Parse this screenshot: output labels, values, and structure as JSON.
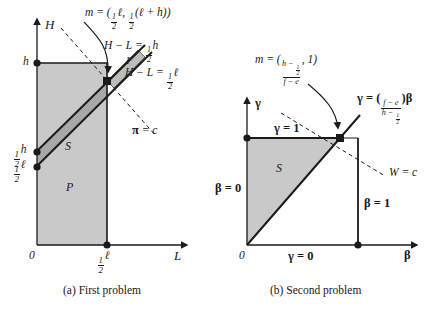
{
  "figure": {
    "kind": "two-panel-geometry-diagram",
    "width": 438,
    "height": 313,
    "background": "#ffffff",
    "ink": "#1a1a1a",
    "fill_light": "#c9c9c9",
    "fill_dark": "#a8a8a8"
  },
  "captions": {
    "a": "(a) First problem",
    "b": "(b) Second problem"
  },
  "panel_a": {
    "axis_y_label": "H",
    "axis_x_label": "L",
    "origin_label": "0",
    "y_tick_h": "h",
    "y_tick_half_h_num": "1",
    "y_tick_half_h_den": "2",
    "y_tick_half_h_sym": "h",
    "y_tick_half_l_num": "1",
    "y_tick_half_l_den": "2",
    "y_tick_half_l_sym": "ℓ",
    "x_tick_half_l_num": "1",
    "x_tick_half_l_den": "2",
    "x_tick_half_l_sym": "ℓ",
    "region_P": "P",
    "region_S": "S",
    "region_I": "I",
    "vertex_label_lhs": "m = (",
    "vertex_label_x_num": "1",
    "vertex_label_x_den": "2",
    "vertex_label_x_sym": "ℓ",
    "vertex_label_comma": ", ",
    "vertex_label_y_num": "1",
    "vertex_label_y_den": "2",
    "vertex_label_y_expr": "(ℓ + h)",
    "vertex_label_rhs": ")",
    "line_upper_lhs": "H − L = ",
    "line_upper_num": "1",
    "line_upper_den": "2",
    "line_upper_sym": "h",
    "line_lower_lhs": "H − L = ",
    "line_lower_num": "1",
    "line_lower_den": "2",
    "line_lower_sym": "ℓ",
    "isoprofit_label_greek": "π",
    "isoprofit_label_rest": " = c"
  },
  "panel_b": {
    "axis_y_label": "γ",
    "axis_x_label": "β",
    "origin_label": "0",
    "region_S": "S",
    "gamma_eq_one": "γ = 1",
    "gamma_eq_zero": "γ = 0",
    "beta_eq_zero": "β = 0",
    "beta_eq_one": "β = 1",
    "vertex_label_lhs": "m = (",
    "vertex_num_lhs": "h − ",
    "vertex_num_frac_num": "1",
    "vertex_num_frac_den": "2",
    "vertex_den": "f − e",
    "vertex_label_rhs": ", 1)",
    "ray_lhs": "γ = (",
    "ray_num": "f − e",
    "ray_den_lhs": "h − ",
    "ray_den_frac_num": "1",
    "ray_den_frac_den": "2",
    "ray_rhs": ")β",
    "isowelfare_label_italic": "W",
    "isowelfare_label_rest": " = c"
  }
}
